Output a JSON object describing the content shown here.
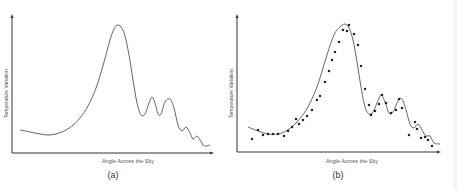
{
  "chart_data": [
    {
      "type": "line",
      "panel": "a",
      "title": "",
      "caption": "(a)",
      "xlabel": "Angle Across the Sky",
      "ylabel": "Temperature Variation",
      "grid": false,
      "legend": null,
      "series": [
        {
          "name": "model curve",
          "description": "Smooth power-spectrum-like curve: low start, shallow trough, one tall primary peak, then damped secondary oscillations",
          "points_px": [
            [
              20,
              130
            ],
            [
              30,
              132
            ],
            [
              40,
              134
            ],
            [
              48,
              135
            ],
            [
              56,
              134
            ],
            [
              64,
              131
            ],
            [
              72,
              126
            ],
            [
              80,
              118
            ],
            [
              88,
              106
            ],
            [
              96,
              88
            ],
            [
              104,
              62
            ],
            [
              110,
              40
            ],
            [
              114,
              29
            ],
            [
              117,
              25
            ],
            [
              121,
              27
            ],
            [
              125,
              36
            ],
            [
              129,
              55
            ],
            [
              133,
              80
            ],
            [
              137,
              103
            ],
            [
              141,
              115
            ],
            [
              145,
              114
            ],
            [
              149,
              103
            ],
            [
              152,
              97
            ],
            [
              155,
              103
            ],
            [
              158,
              114
            ],
            [
              161,
              114
            ],
            [
              165,
              102
            ],
            [
              170,
              99
            ],
            [
              174,
              108
            ],
            [
              178,
              125
            ],
            [
              182,
              131
            ],
            [
              186,
              127
            ],
            [
              190,
              133
            ],
            [
              193,
              139
            ],
            [
              197,
              136
            ],
            [
              200,
              140
            ],
            [
              203,
              145
            ],
            [
              206,
              146
            ],
            [
              210,
              145
            ]
          ]
        }
      ]
    },
    {
      "type": "scatter",
      "panel": "b",
      "title": "",
      "caption": "(b)",
      "xlabel": "Angle Across the Sky",
      "ylabel": "Temperature Variation",
      "grid": false,
      "legend": null,
      "series": [
        {
          "name": "model curve",
          "description": "Same curve shape as panel (a), drawn through the observed points",
          "points_px": [
            [
              20,
              127
            ],
            [
              30,
              131
            ],
            [
              40,
              134
            ],
            [
              50,
              134
            ],
            [
              58,
              131
            ],
            [
              66,
              125
            ],
            [
              74,
              116
            ],
            [
              82,
              103
            ],
            [
              90,
              84
            ],
            [
              98,
              58
            ],
            [
              106,
              35
            ],
            [
              112,
              27
            ],
            [
              117,
              24
            ],
            [
              121,
              28
            ],
            [
              125,
              40
            ],
            [
              129,
              62
            ],
            [
              133,
              87
            ],
            [
              137,
              107
            ],
            [
              141,
              114
            ],
            [
              145,
              112
            ],
            [
              149,
              103
            ],
            [
              153,
              95
            ],
            [
              157,
              102
            ],
            [
              161,
              113
            ],
            [
              165,
              112
            ],
            [
              170,
              101
            ],
            [
              174,
              99
            ],
            [
              178,
              110
            ],
            [
              182,
              124
            ],
            [
              186,
              128
            ],
            [
              190,
              124
            ],
            [
              194,
              130
            ],
            [
              198,
              136
            ],
            [
              202,
              136
            ],
            [
              206,
              143
            ],
            [
              212,
              144
            ]
          ]
        },
        {
          "name": "observed data",
          "description": "Measured data points scattered around the curve",
          "points_px": [
            [
              24,
              139
            ],
            [
              30,
              130
            ],
            [
              35,
              135
            ],
            [
              40,
              134
            ],
            [
              45,
              134
            ],
            [
              50,
              134
            ],
            [
              56,
              136
            ],
            [
              60,
              131
            ],
            [
              64,
              127
            ],
            [
              68,
              119
            ],
            [
              71,
              124
            ],
            [
              75,
              120
            ],
            [
              79,
              116
            ],
            [
              84,
              110
            ],
            [
              89,
              100
            ],
            [
              92,
              96
            ],
            [
              97,
              82
            ],
            [
              101,
              71
            ],
            [
              104,
              60
            ],
            [
              107,
              52
            ],
            [
              111,
              42
            ],
            [
              115,
              30
            ],
            [
              119,
              31
            ],
            [
              121,
              25
            ],
            [
              126,
              34
            ],
            [
              130,
              45
            ],
            [
              133,
              66
            ],
            [
              137,
              89
            ],
            [
              141,
              105
            ],
            [
              143,
              115
            ],
            [
              147,
              111
            ],
            [
              151,
              104
            ],
            [
              154,
              95
            ],
            [
              158,
              103
            ],
            [
              163,
              113
            ],
            [
              168,
              110
            ],
            [
              171,
              99
            ],
            [
              174,
              108
            ],
            [
              181,
              135
            ],
            [
              187,
              122
            ],
            [
              189,
              129
            ],
            [
              193,
              138
            ],
            [
              197,
              137
            ],
            [
              200,
              140
            ],
            [
              204,
              146
            ]
          ]
        }
      ]
    }
  ]
}
